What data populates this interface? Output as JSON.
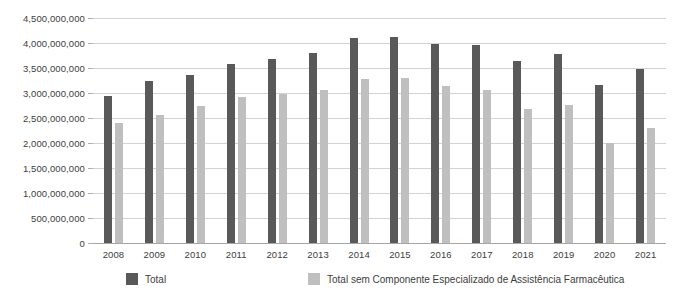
{
  "chart_data": {
    "type": "bar",
    "title": "",
    "subtitle": "",
    "xlabel": "",
    "ylabel": "",
    "grid": true,
    "legend_position": "bottom",
    "ylim": [
      0,
      4500000000
    ],
    "ytick_labels": [
      "4,500,000,000",
      "4,000,000,000",
      "3,500,000,000",
      "3,000,000,000",
      "2,500,000,000",
      "2,000,000,000",
      "1,500,000,000",
      "1,000,000,000",
      "500,000,000",
      "0"
    ],
    "ytick_values": [
      4500000000,
      4000000000,
      3500000000,
      3000000000,
      2500000000,
      2000000000,
      1500000000,
      1000000000,
      500000000,
      0
    ],
    "categories": [
      "2008",
      "2009",
      "2010",
      "2011",
      "2012",
      "2013",
      "2014",
      "2015",
      "2016",
      "2017",
      "2018",
      "2019",
      "2020",
      "2021"
    ],
    "series": [
      {
        "name": "Total",
        "color": "#595959",
        "values": [
          2940000000,
          3250000000,
          3360000000,
          3580000000,
          3690000000,
          3800000000,
          4100000000,
          4120000000,
          3990000000,
          3970000000,
          3640000000,
          3780000000,
          3170000000,
          3490000000
        ]
      },
      {
        "name": "Total sem Componente Especializado de Assistência Farmacêutica",
        "color": "#bfbfbf",
        "values": [
          2400000000,
          2570000000,
          2740000000,
          2930000000,
          2980000000,
          3060000000,
          3280000000,
          3300000000,
          3150000000,
          3060000000,
          2680000000,
          2760000000,
          2010000000,
          2300000000
        ]
      }
    ]
  },
  "legend": {
    "items": [
      {
        "label": "Total",
        "color": "#595959"
      },
      {
        "label": "Total sem Componente Especializado de Assistência Farmacêutica",
        "color": "#bfbfbf"
      }
    ]
  },
  "colors": {
    "series_total": "#595959",
    "series_semcomp": "#bfbfbf",
    "gridline": "#d3d3d3",
    "baseline": "#a6a6a6",
    "text": "#3d3d3d",
    "background": "#ffffff"
  }
}
